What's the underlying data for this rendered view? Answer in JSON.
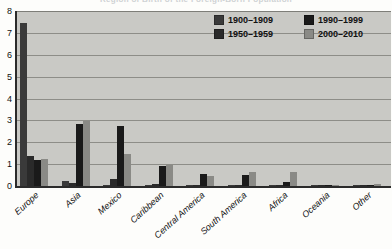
{
  "title_faded": "Region of Birth of the Foreign-Born Population",
  "legend": {
    "position": "top-right",
    "items": [
      {
        "label": "1900–1909",
        "color": "#3a3a3a"
      },
      {
        "label": "1990–1999",
        "color": "#1a1a1a"
      },
      {
        "label": "1950–1959",
        "color": "#2a2a2a"
      },
      {
        "label": "2000–2010",
        "color": "#8a8a86"
      }
    ]
  },
  "axis": {
    "y_ticks": [
      "8",
      "7",
      "6",
      "5",
      "4",
      "3",
      "2",
      "1",
      "0"
    ]
  },
  "chart_data": {
    "type": "bar",
    "title": "Region of Birth of the Foreign-Born Population",
    "xlabel": "",
    "ylabel": "",
    "ylim": [
      0,
      8
    ],
    "ystep": 1,
    "grid": true,
    "legend_position": "top-right",
    "categories": [
      "Europe",
      "Asia",
      "Mexico",
      "Caribbean",
      "Central America",
      "South America",
      "Africa",
      "Oceania",
      "Other"
    ],
    "series": [
      {
        "name": "1900–1909",
        "color": "#3a3a3a",
        "values": [
          7.45,
          0.25,
          0.03,
          0.05,
          0.02,
          0.03,
          0.02,
          0.0,
          0.0
        ]
      },
      {
        "name": "1950–1959",
        "color": "#2a2a2a",
        "values": [
          1.35,
          0.12,
          0.3,
          0.07,
          0.03,
          0.05,
          0.03,
          0.0,
          0.0
        ]
      },
      {
        "name": "1990–1999",
        "color": "#1a1a1a",
        "values": [
          1.2,
          2.82,
          2.75,
          0.93,
          0.55,
          0.5,
          0.2,
          0.02,
          0.02
        ]
      },
      {
        "name": "2000–2010",
        "color": "#8a8a86",
        "values": [
          1.22,
          2.95,
          1.48,
          0.95,
          0.48,
          0.65,
          0.65,
          0.05,
          0.07
        ]
      }
    ]
  }
}
